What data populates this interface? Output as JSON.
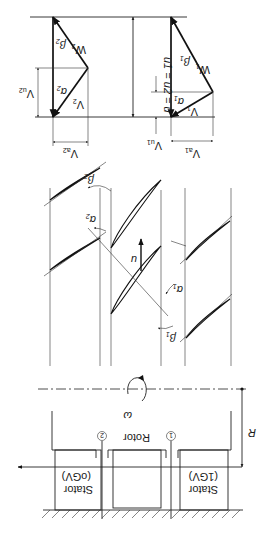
{
  "figure": {
    "orientation": "rotated 180 degrees",
    "velocity_triangles": {
      "inlet": {
        "labels": {
          "absolute_velocity": "V",
          "absolute_sub": "1",
          "relative_velocity": "W",
          "relative_sub": "1",
          "axial": "V",
          "axial_sub": "a1",
          "tangential": "V",
          "tangential_sub": "u1",
          "alpha": "α",
          "alpha_sub": "1",
          "beta": "β",
          "beta_sub": "1"
        }
      },
      "outlet": {
        "labels": {
          "absolute_velocity": "V",
          "absolute_sub": "2",
          "relative_velocity": "W",
          "relative_sub": "2",
          "axial": "V",
          "axial_sub": "a2",
          "tangential": "V",
          "tangential_sub": "u2",
          "alpha": "α",
          "alpha_sub": "2",
          "beta": "β",
          "beta_sub": "2"
        }
      },
      "blade_speed_label": "u1 = u2 = u"
    },
    "cascade": {
      "blade_speed": "u",
      "angles": {
        "alpha1": "α",
        "alpha1_sub": "1",
        "beta1": "β",
        "beta1_sub": "1",
        "alpha2": "α",
        "alpha2_sub": "2",
        "beta2": "β",
        "beta2_sub": "2"
      }
    },
    "meridional": {
      "stator_inlet_label": "Stator",
      "stator_inlet_sub": "(1GV)",
      "rotor_label": "Rotor",
      "stator_outlet_label": "Stator",
      "stator_outlet_sub": "(oGV)",
      "station_1": "1",
      "station_2": "2",
      "omega": "ω",
      "radius": "R"
    },
    "colors": {
      "line": "#222222",
      "background": "#ffffff"
    }
  }
}
